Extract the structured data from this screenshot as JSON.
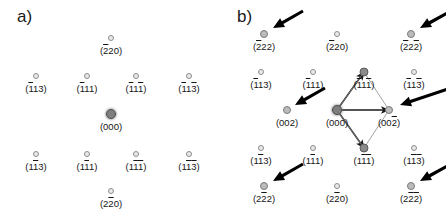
{
  "figure": {
    "width": 446,
    "height": 213,
    "background": "#ffffff",
    "spot_colors": {
      "weak_fill": "#e9e9e9",
      "weak_stroke": "#8d8d8d",
      "medium_fill": "#bcbcbc",
      "strong_fill": "#8a8a8a",
      "center_fill": "#7e7e7e",
      "label_color": "#151515",
      "arrow_color": "#000000",
      "vector_color": "#1a1a1a",
      "thin_line_color": "#8a8a8a"
    }
  },
  "panels": [
    {
      "id": "a",
      "label": "a)",
      "description": "electron diffraction pattern, 10 reflections, no marker arrows",
      "spots": [
        {
          "name": "2bar20",
          "x": 111,
          "y": 38,
          "intensity": "weak",
          "label": "(220)",
          "overbars": [
            1,
            0,
            0
          ]
        },
        {
          "name": "1bar13",
          "x": 36,
          "y": 76,
          "intensity": "weak",
          "label": "(113)",
          "overbars": [
            1,
            0,
            0
          ]
        },
        {
          "name": "1bar11",
          "x": 87,
          "y": 76,
          "intensity": "weak",
          "label": "(111)",
          "overbars": [
            1,
            0,
            0
          ]
        },
        {
          "name": "1bar11bar",
          "x": 136,
          "y": 76,
          "intensity": "weak",
          "label": "(111)",
          "overbars": [
            1,
            0,
            1
          ]
        },
        {
          "name": "1bar13bar",
          "x": 189,
          "y": 76,
          "intensity": "weak",
          "label": "(113)",
          "overbars": [
            1,
            0,
            1
          ]
        },
        {
          "name": "000",
          "x": 111,
          "y": 114,
          "intensity": "center",
          "label": "(000)",
          "overbars": [
            0,
            0,
            0
          ]
        },
        {
          "name": "11bar3",
          "x": 36,
          "y": 154,
          "intensity": "weak",
          "label": "(113)",
          "overbars": [
            0,
            1,
            0
          ]
        },
        {
          "name": "11bar1",
          "x": 87,
          "y": 154,
          "intensity": "weak",
          "label": "(111)",
          "overbars": [
            0,
            1,
            0
          ]
        },
        {
          "name": "11bar1bar",
          "x": 136,
          "y": 154,
          "intensity": "weak",
          "label": "(111)",
          "overbars": [
            0,
            1,
            1
          ]
        },
        {
          "name": "11bar3bar",
          "x": 189,
          "y": 154,
          "intensity": "weak",
          "label": "(113)",
          "overbars": [
            0,
            1,
            1
          ]
        },
        {
          "name": "22bar0",
          "x": 111,
          "y": 191,
          "intensity": "weak",
          "label": "(220)",
          "overbars": [
            0,
            1,
            0
          ]
        }
      ],
      "arrows": [],
      "vectors": []
    },
    {
      "id": "b",
      "label": "b)",
      "description": "electron diffraction pattern with arrows marking extra superlattice reflections and a rhombus of basis vectors from (000)",
      "spots": [
        {
          "name": "2bar22",
          "x": 41,
          "y": 34,
          "intensity": "medium",
          "label": "(222)",
          "overbars": [
            1,
            0,
            0
          ]
        },
        {
          "name": "2bar20",
          "x": 114,
          "y": 34,
          "intensity": "weak",
          "label": "(220)",
          "overbars": [
            1,
            0,
            0
          ]
        },
        {
          "name": "2bar22bar",
          "x": 188,
          "y": 34,
          "intensity": "medium",
          "label": "(222)",
          "overbars": [
            1,
            0,
            1
          ]
        },
        {
          "name": "1bar13",
          "x": 38,
          "y": 72,
          "intensity": "weak",
          "label": "(113)",
          "overbars": [
            1,
            0,
            0
          ]
        },
        {
          "name": "1bar11",
          "x": 90,
          "y": 72,
          "intensity": "weak",
          "label": "(111)",
          "overbars": [
            1,
            0,
            0
          ]
        },
        {
          "name": "1bar11bar",
          "x": 141,
          "y": 72,
          "intensity": "strong",
          "label": "(111)",
          "overbars": [
            1,
            0,
            1
          ]
        },
        {
          "name": "1bar13bar",
          "x": 191,
          "y": 72,
          "intensity": "weak",
          "label": "(113)",
          "overbars": [
            1,
            0,
            1
          ]
        },
        {
          "name": "002",
          "x": 64,
          "y": 110,
          "intensity": "medium",
          "label": "(002)",
          "overbars": [
            0,
            0,
            0
          ]
        },
        {
          "name": "000",
          "x": 114,
          "y": 110,
          "intensity": "center",
          "label": "(000)",
          "overbars": [
            0,
            0,
            0
          ]
        },
        {
          "name": "002bar",
          "x": 166,
          "y": 110,
          "intensity": "medium",
          "label": "(002)",
          "overbars": [
            0,
            0,
            1
          ]
        },
        {
          "name": "11bar3",
          "x": 38,
          "y": 148,
          "intensity": "weak",
          "label": "(113)",
          "overbars": [
            0,
            1,
            0
          ]
        },
        {
          "name": "11bar1",
          "x": 90,
          "y": 148,
          "intensity": "weak",
          "label": "(111)",
          "overbars": [
            0,
            1,
            0
          ]
        },
        {
          "name": "11bar1bar",
          "x": 141,
          "y": 148,
          "intensity": "strong",
          "label": "(111)",
          "overbars": [
            0,
            1,
            1
          ]
        },
        {
          "name": "11bar3bar",
          "x": 191,
          "y": 148,
          "intensity": "weak",
          "label": "(113)",
          "overbars": [
            0,
            1,
            1
          ]
        },
        {
          "name": "22bar2",
          "x": 41,
          "y": 186,
          "intensity": "medium",
          "label": "(222)",
          "overbars": [
            0,
            1,
            0
          ]
        },
        {
          "name": "22bar0",
          "x": 114,
          "y": 186,
          "intensity": "weak",
          "label": "(220)",
          "overbars": [
            0,
            1,
            0
          ]
        },
        {
          "name": "22bar2bar",
          "x": 188,
          "y": 186,
          "intensity": "medium",
          "label": "(222)",
          "overbars": [
            0,
            1,
            1
          ]
        }
      ],
      "arrows": [
        {
          "name": "arrow-2bar22",
          "x1": 80,
          "y1": 11,
          "x2": 50,
          "y2": 28,
          "points_to": "2bar22"
        },
        {
          "name": "arrow-2bar22bar",
          "x1": 228,
          "y1": 11,
          "x2": 197,
          "y2": 28,
          "points_to": "2bar22bar"
        },
        {
          "name": "arrow-002",
          "x1": 102,
          "y1": 88,
          "x2": 72,
          "y2": 105,
          "points_to": "002"
        },
        {
          "name": "arrow-002bar",
          "x1": 228,
          "y1": 88,
          "x2": 177,
          "y2": 105,
          "points_to": "002bar"
        },
        {
          "name": "arrow-22bar2",
          "x1": 80,
          "y1": 164,
          "x2": 50,
          "y2": 181,
          "points_to": "22bar2"
        },
        {
          "name": "arrow-22bar2bar",
          "x1": 228,
          "y1": 164,
          "x2": 197,
          "y2": 181,
          "points_to": "22bar2bar"
        }
      ],
      "vectors": [
        {
          "name": "vector-000-to-1bar11bar",
          "x1": 114,
          "y1": 110,
          "x2": 141,
          "y2": 72,
          "style": "bold"
        },
        {
          "name": "vector-000-to-002bar",
          "x1": 114,
          "y1": 110,
          "x2": 166,
          "y2": 110,
          "style": "bold"
        },
        {
          "name": "vector-000-to-11bar1bar",
          "x1": 114,
          "y1": 110,
          "x2": 141,
          "y2": 148,
          "style": "bold"
        },
        {
          "name": "edge-1bar11bar-to-002bar",
          "x1": 141,
          "y1": 72,
          "x2": 166,
          "y2": 110,
          "style": "thin"
        },
        {
          "name": "edge-002bar-to-11bar1bar",
          "x1": 166,
          "y1": 110,
          "x2": 141,
          "y2": 148,
          "style": "thin"
        },
        {
          "name": "edge-000-to-1bar11bar-thin",
          "x1": 114,
          "y1": 110,
          "x2": 141,
          "y2": 72,
          "style": "thin"
        },
        {
          "name": "edge-000-to-11bar1bar-thin",
          "x1": 114,
          "y1": 110,
          "x2": 141,
          "y2": 148,
          "style": "thin"
        }
      ]
    }
  ]
}
